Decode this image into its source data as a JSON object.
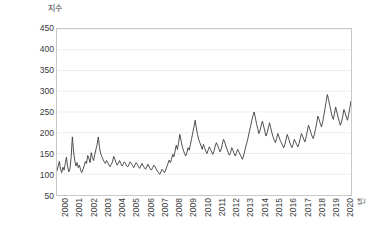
{
  "chart_data": {
    "type": "line",
    "title": "",
    "subtitle": "",
    "ylabel": "지수",
    "xlabel": "년",
    "ylim": [
      50,
      450
    ],
    "yticks": [
      450,
      400,
      350,
      300,
      250,
      200,
      150,
      100
    ],
    "ytick_labels": [
      "450",
      "400",
      "350",
      "300",
      "250",
      "200",
      "150",
      "100"
    ],
    "axis_bottom_label": "50",
    "grid": true,
    "grid_axis": "y",
    "legend": "none",
    "line_color": "#3a3a3a",
    "grid_color": "#eeeeee",
    "frame_color": "#c8c8c8",
    "x_start": 2000,
    "x_end": 2020.75,
    "x_tick_years": [
      2000,
      2001,
      2002,
      2003,
      2004,
      2005,
      2006,
      2007,
      2008,
      2009,
      2010,
      2011,
      2012,
      2013,
      2014,
      2015,
      2016,
      2017,
      2018,
      2019,
      2020
    ],
    "x_tick_labels": [
      "2000",
      "2001",
      "2002",
      "2003",
      "2004",
      "2005",
      "2006",
      "2007",
      "2008",
      "2009",
      "2010",
      "2011",
      "2012",
      "2013",
      "2014",
      "2015",
      "2016",
      "2017",
      "2018",
      "2019",
      "2020"
    ],
    "series": [
      {
        "name": "지수",
        "frequency": "monthly",
        "start_year": 2000,
        "values": [
          108,
          120,
          131,
          112,
          104,
          117,
          110,
          126,
          141,
          118,
          106,
          113,
          142,
          190,
          156,
          134,
          120,
          128,
          116,
          122,
          110,
          104,
          112,
          120,
          131,
          126,
          145,
          138,
          128,
          152,
          140,
          133,
          148,
          160,
          172,
          190,
          164,
          150,
          142,
          136,
          130,
          126,
          133,
          128,
          122,
          118,
          124,
          130,
          143,
          136,
          128,
          122,
          127,
          133,
          126,
          120,
          124,
          130,
          126,
          120,
          118,
          124,
          130,
          126,
          121,
          116,
          122,
          128,
          124,
          118,
          114,
          120,
          126,
          120,
          116,
          112,
          118,
          124,
          118,
          113,
          110,
          116,
          122,
          118,
          113,
          108,
          104,
          100,
          106,
          112,
          108,
          104,
          110,
          118,
          126,
          134,
          128,
          136,
          148,
          142,
          156,
          170,
          160,
          176,
          196,
          182,
          168,
          158,
          150,
          144,
          152,
          164,
          158,
          172,
          186,
          200,
          214,
          230,
          212,
          196,
          184,
          176,
          168,
          160,
          172,
          164,
          156,
          150,
          158,
          166,
          160,
          154,
          148,
          156,
          168,
          176,
          170,
          162,
          154,
          160,
          172,
          184,
          178,
          168,
          160,
          152,
          146,
          152,
          164,
          158,
          150,
          144,
          152,
          160,
          154,
          148,
          142,
          136,
          144,
          156,
          168,
          178,
          190,
          204,
          216,
          230,
          242,
          250,
          236,
          222,
          210,
          198,
          206,
          218,
          228,
          216,
          204,
          192,
          200,
          212,
          224,
          212,
          200,
          190,
          182,
          176,
          186,
          198,
          190,
          182,
          176,
          170,
          164,
          172,
          184,
          196,
          188,
          178,
          170,
          164,
          172,
          184,
          178,
          172,
          166,
          174,
          186,
          198,
          192,
          184,
          178,
          190,
          204,
          218,
          210,
          200,
          192,
          186,
          196,
          210,
          224,
          240,
          232,
          222,
          214,
          226,
          242,
          258,
          276,
          292,
          280,
          266,
          252,
          240,
          232,
          246,
          262,
          250,
          238,
          228,
          218,
          226,
          240,
          256,
          248,
          238,
          230,
          244,
          260,
          276,
          268,
          256,
          246,
          238,
          252,
          268,
          284,
          300,
          288,
          276,
          264,
          252,
          244,
          256,
          272,
          288,
          276,
          264,
          252,
          244,
          258,
          276,
          294,
          310,
          298,
          286,
          274,
          288,
          306,
          324,
          312,
          298,
          286,
          300,
          320,
          340,
          328,
          314,
          300,
          290,
          304,
          322,
          344,
          366,
          352,
          336,
          322,
          340,
          362,
          386,
          404,
          388,
          370,
          356,
          372,
          396,
          424,
          400,
          372,
          352,
          344
        ]
      }
    ]
  }
}
